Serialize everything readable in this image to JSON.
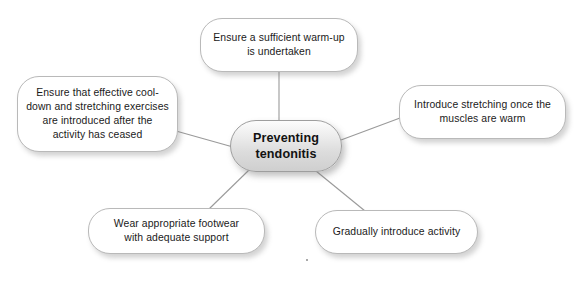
{
  "diagram": {
    "type": "mind-map",
    "title": "Preventing tendonitis",
    "background_color": "#ffffff",
    "edge_color": "#9a9a9a",
    "node_fill": "#ffffff",
    "node_border": "#b9b9b9",
    "center_node": {
      "label": "Preventing\ntendonitis",
      "line1": "Preventing",
      "line2": "tendonitis",
      "fill_top": "#fcfcfc",
      "fill_bottom": "#cfcfcf"
    },
    "nodes": [
      {
        "id": "warm-up",
        "line1": "Ensure a sufficient warm-up",
        "line2": "is undertaken"
      },
      {
        "id": "cool-down",
        "line1": "Ensure that effective cool-",
        "line2": "down and stretching exercises",
        "line3": "are introduced after the",
        "line4": "activity has ceased"
      },
      {
        "id": "stretching",
        "line1": "Introduce stretching once the",
        "line2": "muscles are warm"
      },
      {
        "id": "footwear",
        "line1": "Wear appropriate footwear",
        "line2": "with adequate support"
      },
      {
        "id": "gradual-activity",
        "line1": "Gradually introduce activity"
      }
    ]
  }
}
